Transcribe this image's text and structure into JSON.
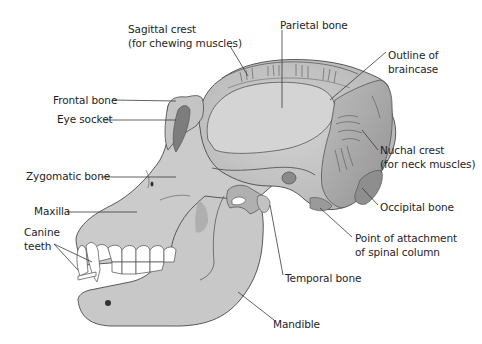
{
  "diagram": {
    "colors": {
      "bone": "#c9c9c9",
      "bone_light": "#d6d6d6",
      "bone_dark": "#9a9a9a",
      "socket": "#7d7d7d",
      "outline": "#4a4a4a",
      "teeth": "#ffffff",
      "text": "#1e1e1e",
      "leader": "#3a3a3a"
    },
    "labels": {
      "sagittal_crest": {
        "line1": "Sagittal crest",
        "line2": "(for chewing muscles)"
      },
      "parietal_bone": {
        "line1": "Parietal bone"
      },
      "outline_braincase": {
        "line1": "Outline of",
        "line2": "braincase"
      },
      "frontal_bone": {
        "line1": "Frontal bone"
      },
      "eye_socket": {
        "line1": "Eye socket"
      },
      "nuchal_crest": {
        "line1": "Nuchal crest",
        "line2": "(for neck muscles)"
      },
      "zygomatic_bone": {
        "line1": "Zygomatic bone"
      },
      "maxilla": {
        "line1": "Maxilla"
      },
      "canine_teeth": {
        "line1": "Canine",
        "line2": "teeth"
      },
      "occipital_bone": {
        "line1": "Occipital bone"
      },
      "spinal_attachment": {
        "line1": "Point of attachment",
        "line2": "of spinal column"
      },
      "temporal_bone": {
        "line1": "Temporal bone"
      },
      "mandible": {
        "line1": "Mandible"
      }
    }
  }
}
